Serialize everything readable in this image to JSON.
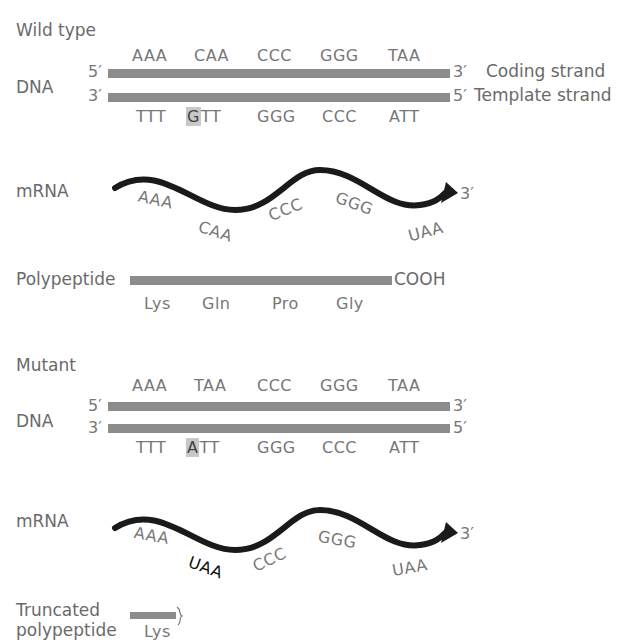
{
  "wild_type": {
    "title": "Wild type",
    "dna_label": "DNA",
    "coding_prime_left": "5′",
    "coding_prime_right": "3′",
    "template_prime_left": "3′",
    "template_prime_right": "5′",
    "coding_strand_label": "Coding strand",
    "template_strand_label": "Template strand",
    "coding_codons": [
      "AAA",
      "CAA",
      "CCC",
      "GGG",
      "TAA"
    ],
    "template_codons": [
      {
        "highlight": "G",
        "rest": ""
      },
      {
        "highlight": "",
        "rest": ""
      }
    ],
    "template_codon_1": "TTT",
    "template_codon_2_highlight": "G",
    "template_codon_2_rest": "TT",
    "template_codon_3": "GGG",
    "template_codon_4": "CCC",
    "template_codon_5": "ATT",
    "mrna_label": "mRNA",
    "mrna_end": "3′",
    "mrna_codons": [
      "AAA",
      "CAA",
      "CCC",
      "GGG",
      "UAA"
    ],
    "polypeptide_label": "Polypeptide",
    "polypeptide_end": "COOH",
    "amino_acids": [
      "Lys",
      "Gln",
      "Pro",
      "Gly"
    ]
  },
  "mutant": {
    "title": "Mutant",
    "dna_label": "DNA",
    "coding_prime_left": "5′",
    "coding_prime_right": "3′",
    "template_prime_left": "3′",
    "template_prime_right": "5′",
    "coding_codons": [
      "AAA",
      "TAA",
      "CCC",
      "GGG",
      "TAA"
    ],
    "template_codon_1": "TTT",
    "template_codon_2_highlight": "A",
    "template_codon_2_rest": "TT",
    "template_codon_3": "GGG",
    "template_codon_4": "CCC",
    "template_codon_5": "ATT",
    "mrna_label": "mRNA",
    "mrna_end": "3′",
    "mrna_codons": [
      "AAA",
      "UAA",
      "CCC",
      "GGG",
      "UAA"
    ],
    "truncated_label_line1": "Truncated",
    "truncated_label_line2": "polypeptide",
    "amino_acids": [
      "Lys"
    ]
  },
  "colors": {
    "strand": "#8c8c8c",
    "mrna": "#1a1a1a",
    "highlight": "#c8c8c8",
    "text": "#6e6e6e"
  }
}
